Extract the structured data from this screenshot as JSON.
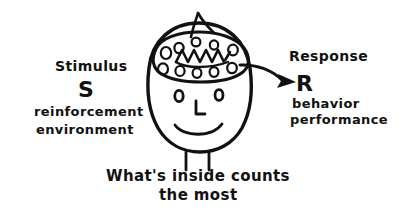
{
  "figure": {
    "title": "What's inside counts the most",
    "type": "hand-drawn-diagram",
    "background_color": "#ffffff",
    "ink_color": "#111111"
  },
  "left_labels": {
    "heading": "Stimulus",
    "symbol": "S",
    "detail_line1": "reinforcement",
    "detail_line2": "environment"
  },
  "right_labels": {
    "heading": "Response",
    "symbol": "R",
    "detail_line1": "behavior",
    "detail_line2": "performance"
  },
  "caption": {
    "line1": "What's inside counts",
    "line2": "the most"
  },
  "drawing": {
    "head_name": "head-outline",
    "brain_name": "brain-blob",
    "hair_name": "hair-tuft",
    "eyes_name": "eyes",
    "nose_name": "nose",
    "mouth_name": "smile",
    "neck_name": "neck",
    "arrow_name": "response-arrow",
    "brain_dot_count": 10,
    "brain_squiggle": "zigzag"
  }
}
